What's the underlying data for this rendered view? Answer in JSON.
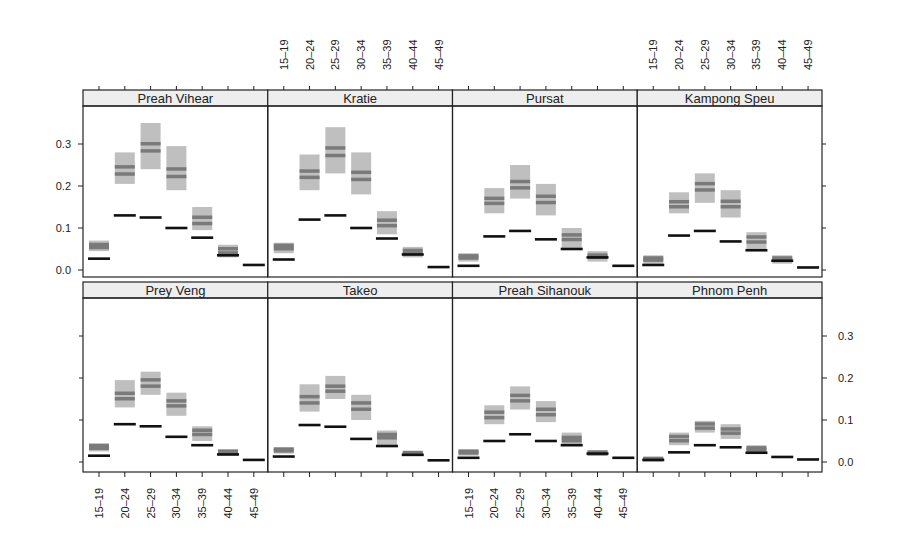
{
  "chart_data": {
    "type": "trellis-interval",
    "title": "",
    "xlabel": "",
    "ylabel": "",
    "ylim": [
      0.0,
      0.35
    ],
    "y_ticks": [
      0.0,
      0.1,
      0.2,
      0.3
    ],
    "y_tick_labels": [
      "0.0",
      "0.1",
      "0.2",
      "0.3"
    ],
    "categories": [
      "15–19",
      "20–24",
      "25–29",
      "30–34",
      "35–39",
      "40–44",
      "45–49"
    ],
    "layout": {
      "columns": 4,
      "rows": 2
    },
    "series_description": {
      "interval": "gray band (lower/upper) with two darker inner lines",
      "point": "black horizontal bar"
    },
    "panels": [
      {
        "name": "Preah Vihear",
        "interval_low": [
          0.045,
          0.205,
          0.24,
          0.19,
          0.095,
          0.03,
          0.0
        ],
        "interval_high": [
          0.07,
          0.28,
          0.35,
          0.295,
          0.15,
          0.06,
          0.0
        ],
        "inner_a": [
          0.06,
          0.245,
          0.3,
          0.24,
          0.125,
          0.05,
          0.0
        ],
        "inner_b": [
          0.053,
          0.228,
          0.283,
          0.222,
          0.11,
          0.04,
          0.0
        ],
        "point": [
          0.027,
          0.13,
          0.125,
          0.1,
          0.077,
          0.035,
          0.012
        ]
      },
      {
        "name": "Kratie",
        "interval_low": [
          0.04,
          0.19,
          0.23,
          0.18,
          0.085,
          0.03,
          0.0
        ],
        "interval_high": [
          0.065,
          0.275,
          0.34,
          0.28,
          0.14,
          0.055,
          0.0
        ],
        "inner_a": [
          0.058,
          0.235,
          0.29,
          0.232,
          0.118,
          0.046,
          0.0
        ],
        "inner_b": [
          0.05,
          0.22,
          0.272,
          0.215,
          0.105,
          0.038,
          0.0
        ],
        "point": [
          0.025,
          0.12,
          0.13,
          0.1,
          0.075,
          0.037,
          0.007
        ]
      },
      {
        "name": "Pursat",
        "interval_low": [
          0.02,
          0.135,
          0.17,
          0.13,
          0.05,
          0.02,
          0.0
        ],
        "interval_high": [
          0.04,
          0.195,
          0.25,
          0.205,
          0.1,
          0.045,
          0.0
        ],
        "inner_a": [
          0.033,
          0.17,
          0.21,
          0.175,
          0.083,
          0.035,
          0.0
        ],
        "inner_b": [
          0.028,
          0.158,
          0.195,
          0.16,
          0.072,
          0.03,
          0.0
        ],
        "point": [
          0.01,
          0.08,
          0.093,
          0.073,
          0.05,
          0.03,
          0.01
        ]
      },
      {
        "name": "Kampong Speu",
        "interval_low": [
          0.015,
          0.135,
          0.16,
          0.125,
          0.05,
          0.015,
          0.0
        ],
        "interval_high": [
          0.035,
          0.185,
          0.23,
          0.19,
          0.09,
          0.035,
          0.0
        ],
        "inner_a": [
          0.028,
          0.162,
          0.205,
          0.163,
          0.078,
          0.028,
          0.0
        ],
        "inner_b": [
          0.023,
          0.15,
          0.19,
          0.15,
          0.066,
          0.023,
          0.0
        ],
        "point": [
          0.012,
          0.082,
          0.093,
          0.068,
          0.047,
          0.022,
          0.006
        ]
      },
      {
        "name": "Prey Veng",
        "interval_low": [
          0.025,
          0.13,
          0.16,
          0.11,
          0.05,
          0.015,
          0.0
        ],
        "interval_high": [
          0.045,
          0.195,
          0.215,
          0.165,
          0.085,
          0.03,
          0.0
        ],
        "inner_a": [
          0.038,
          0.163,
          0.195,
          0.145,
          0.075,
          0.025,
          0.0
        ],
        "inner_b": [
          0.032,
          0.15,
          0.18,
          0.133,
          0.065,
          0.02,
          0.0
        ],
        "point": [
          0.015,
          0.09,
          0.085,
          0.06,
          0.04,
          0.018,
          0.005
        ]
      },
      {
        "name": "Takeo",
        "interval_low": [
          0.02,
          0.12,
          0.15,
          0.1,
          0.04,
          0.015,
          0.0
        ],
        "interval_high": [
          0.035,
          0.185,
          0.205,
          0.16,
          0.075,
          0.025,
          0.0
        ],
        "inner_a": [
          0.03,
          0.155,
          0.18,
          0.14,
          0.065,
          0.022,
          0.0
        ],
        "inner_b": [
          0.026,
          0.14,
          0.168,
          0.125,
          0.057,
          0.018,
          0.0
        ],
        "point": [
          0.013,
          0.088,
          0.084,
          0.055,
          0.038,
          0.017,
          0.004
        ]
      },
      {
        "name": "Preah Sihanouk",
        "interval_low": [
          0.015,
          0.09,
          0.125,
          0.095,
          0.04,
          0.015,
          0.0
        ],
        "interval_high": [
          0.03,
          0.135,
          0.18,
          0.145,
          0.07,
          0.028,
          0.0
        ],
        "inner_a": [
          0.025,
          0.118,
          0.158,
          0.125,
          0.058,
          0.023,
          0.0
        ],
        "inner_b": [
          0.021,
          0.105,
          0.145,
          0.112,
          0.05,
          0.019,
          0.0
        ],
        "point": [
          0.01,
          0.05,
          0.066,
          0.05,
          0.04,
          0.02,
          0.01
        ]
      },
      {
        "name": "Phnom Penh",
        "interval_low": [
          0.002,
          0.04,
          0.07,
          0.055,
          0.02,
          0.0,
          0.0
        ],
        "interval_high": [
          0.012,
          0.07,
          0.098,
          0.09,
          0.04,
          0.0,
          0.0
        ],
        "inner_a": [
          0.008,
          0.06,
          0.09,
          0.078,
          0.033,
          0.0,
          0.0
        ],
        "inner_b": [
          0.005,
          0.05,
          0.08,
          0.068,
          0.028,
          0.0,
          0.0
        ],
        "point": [
          0.005,
          0.023,
          0.04,
          0.035,
          0.022,
          0.012,
          0.006
        ]
      }
    ]
  },
  "colors": {
    "interval_fill": "#b8b8b8",
    "inner_band": "#7a7a7a",
    "point": "#111111",
    "strip_bg": "#eeeeee",
    "border": "#222222"
  }
}
